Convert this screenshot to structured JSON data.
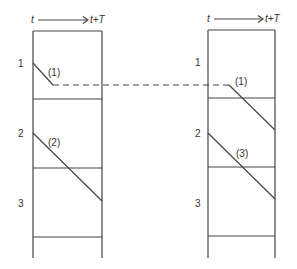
{
  "diagram": {
    "left_panel": {
      "time_axis": {
        "start": "t",
        "end": "t+T"
      },
      "slots": [
        "1",
        "2",
        "3"
      ],
      "paths": [
        {
          "label": "(1)",
          "from_slot": "1"
        },
        {
          "label": "(2)",
          "from_slot": "2"
        }
      ]
    },
    "right_panel": {
      "time_axis": {
        "start": "t",
        "end": "t+T"
      },
      "slots": [
        "1",
        "2",
        "3"
      ],
      "paths": [
        {
          "label": "(1)",
          "from_slot": "1"
        },
        {
          "label": "(3)",
          "from_slot": "2"
        }
      ]
    },
    "connector": {
      "style": "dashed",
      "links": "(1)"
    }
  },
  "colors": {
    "line": "#444444",
    "background": "#ffffff"
  }
}
